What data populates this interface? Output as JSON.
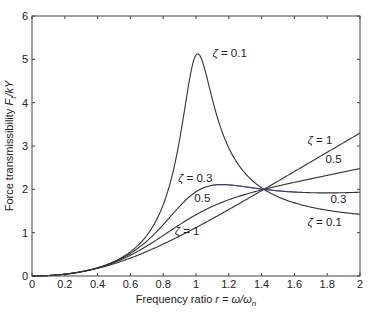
{
  "chart_data": {
    "type": "line",
    "title": "",
    "xlabel": "Frequency ratio r = ω/ωn",
    "xlabel_parts": {
      "prefix": "Frequency ratio ",
      "var": "r",
      "eq": " = ω/ω",
      "sub": "n"
    },
    "ylabel": "Force transmissibility Ft/kY",
    "ylabel_parts": {
      "prefix": "Force transmissibility ",
      "F": "F",
      "sub": "t",
      "rest": "/kY"
    },
    "xlim": [
      0,
      2
    ],
    "ylim": [
      0,
      6
    ],
    "xticks": [
      "0",
      "0.2",
      "0.4",
      "0.6",
      "0.8",
      "1",
      "1.2",
      "1.4",
      "1.6",
      "1.8",
      "2"
    ],
    "yticks": [
      "0",
      "1",
      "2",
      "3",
      "4",
      "5",
      "6"
    ],
    "grid": false,
    "formula": "T = r^2 * sqrt((1+(2ζr)^2)/((1-r^2)^2+(2ζr)^2))",
    "series": [
      {
        "name": "ζ = 0.1",
        "zeta": 0.1,
        "color": "#333333",
        "x": [
          0,
          0.2,
          0.4,
          0.6,
          0.8,
          1.0,
          1.2,
          1.414,
          1.6,
          1.8,
          2.0
        ],
        "values": [
          0,
          0.04,
          0.19,
          0.56,
          1.73,
          5.1,
          3.1,
          2.0,
          1.67,
          1.52,
          1.42
        ]
      },
      {
        "name": "ζ = 0.3",
        "zeta": 0.3,
        "color": "#333333",
        "x": [
          0,
          0.2,
          0.4,
          0.6,
          0.8,
          1.0,
          1.2,
          1.414,
          1.6,
          1.8,
          2.0
        ],
        "values": [
          0,
          0.04,
          0.19,
          0.53,
          1.23,
          1.94,
          2.12,
          2.0,
          1.96,
          1.94,
          1.94
        ]
      },
      {
        "name": "0.5",
        "zeta": 0.5,
        "color": "#333333",
        "x": [
          0,
          0.2,
          0.4,
          0.6,
          0.8,
          1.0,
          1.2,
          1.414,
          1.6,
          1.8,
          2.0
        ],
        "values": [
          0,
          0.04,
          0.18,
          0.49,
          1.0,
          1.41,
          1.71,
          2.0,
          2.2,
          2.38,
          2.53
        ]
      },
      {
        "name": "ζ = 1",
        "zeta": 1.0,
        "color": "#333333",
        "x": [
          0,
          0.2,
          0.4,
          0.6,
          0.8,
          1.0,
          1.2,
          1.414,
          1.6,
          1.8,
          2.0
        ],
        "values": [
          0,
          0.04,
          0.17,
          0.42,
          0.76,
          1.12,
          1.53,
          2.0,
          2.41,
          2.85,
          3.3
        ]
      }
    ],
    "annotations": [
      {
        "text": "ζ = 0.1",
        "x": 1.1,
        "y": 5.05
      },
      {
        "text": "ζ = 0.3",
        "x": 0.89,
        "y": 2.18
      },
      {
        "text": "0.5",
        "x": 0.99,
        "y": 1.7
      },
      {
        "text": "ζ = 1",
        "x": 0.87,
        "y": 0.95
      },
      {
        "text": "ζ = 1",
        "x": 1.68,
        "y": 3.05
      },
      {
        "text": "0.5",
        "x": 1.79,
        "y": 2.6
      },
      {
        "text": "0.3",
        "x": 1.82,
        "y": 1.68
      },
      {
        "text": "ζ = 0.1",
        "x": 1.68,
        "y": 1.15
      }
    ],
    "highlight_color": "#3a3fc0"
  }
}
